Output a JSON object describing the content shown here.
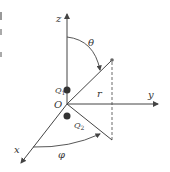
{
  "diagram": {
    "axes": {
      "z": "z",
      "y": "y",
      "x": "x"
    },
    "origin": "O",
    "charges": {
      "q1": {
        "label": "Q",
        "sub": "1"
      },
      "q2": {
        "label": "Q",
        "sub": "2"
      }
    },
    "radius": "r",
    "angles": {
      "theta": "θ",
      "phi": "φ"
    },
    "colors": {
      "line": "#444444",
      "charge": "#333333",
      "background": "#ffffff"
    }
  }
}
